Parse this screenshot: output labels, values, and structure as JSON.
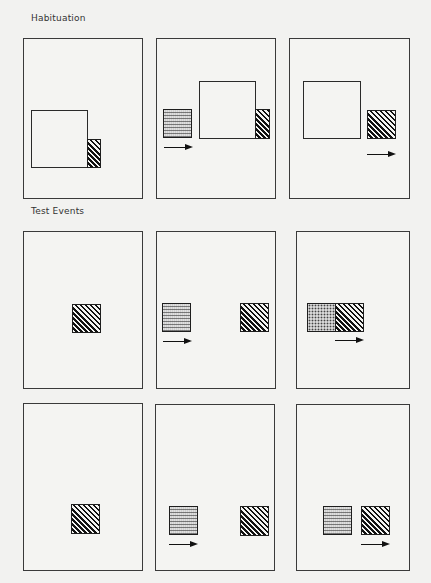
{
  "figure": {
    "sections": [
      {
        "label": "Habituation",
        "panels": [
          {
            "id": "hab-1",
            "objects": [
              "occluder",
              "striped-box"
            ],
            "arrow": false
          },
          {
            "id": "hab-2",
            "objects": [
              "wavy-box",
              "occluder",
              "striped-box"
            ],
            "arrow": true
          },
          {
            "id": "hab-3",
            "objects": [
              "occluder",
              "striped-box"
            ],
            "arrow": true
          }
        ]
      },
      {
        "label": "Test Events",
        "panels": [
          {
            "id": "test-1-1",
            "objects": [
              "striped-box"
            ],
            "arrow": false
          },
          {
            "id": "test-1-2",
            "objects": [
              "wavy-box",
              "striped-box"
            ],
            "arrow": true
          },
          {
            "id": "test-1-3",
            "objects": [
              "dotted-box",
              "striped-box"
            ],
            "arrow": true
          },
          {
            "id": "test-2-1",
            "objects": [
              "striped-box"
            ],
            "arrow": false
          },
          {
            "id": "test-2-2",
            "objects": [
              "wavy-box",
              "striped-box"
            ],
            "arrow": true
          },
          {
            "id": "test-2-3",
            "objects": [
              "wavy-box",
              "striped-box"
            ],
            "arrow": true
          }
        ]
      }
    ]
  },
  "colors": {
    "background": "#f2f2f0",
    "stroke": "#1e1e1e"
  }
}
